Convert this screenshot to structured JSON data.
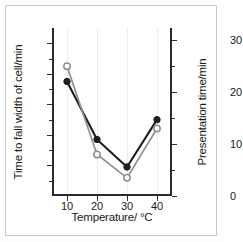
{
  "chart_data": {
    "type": "line",
    "title": "",
    "xlabel": "Temperature/ °C",
    "ylabel": "Time to fall width of cell/min",
    "y2label": "Presentation time/min",
    "x": [
      10,
      20,
      30,
      40
    ],
    "xlim": [
      5,
      45
    ],
    "ylim": [
      0,
      110
    ],
    "y2lim": [
      0,
      32.35
    ],
    "xticks": [
      "10",
      "20",
      "30",
      "40"
    ],
    "yticks": [
      "20",
      "40",
      "60",
      "80",
      "100"
    ],
    "y2ticks": [
      "0",
      "10",
      "20",
      "30"
    ],
    "grid": "vertical",
    "legend": "none",
    "series": [
      {
        "name": "Time to fall width of cell",
        "marker": "filled-circle",
        "axis": "left",
        "unit": "min",
        "color": "#1f1f1f",
        "values": [
          75,
          37,
          19,
          50
        ]
      },
      {
        "name": "Presentation time",
        "marker": "open-circle",
        "axis": "right",
        "unit": "min",
        "color": "#8f8f8f",
        "values": [
          25,
          8,
          3.5,
          13
        ]
      }
    ]
  },
  "axes": {
    "left": {
      "label": "Time to fall width of cell/min",
      "ticks": [
        {
          "text": "100",
          "value": 100
        },
        {
          "text": "80",
          "value": 80
        },
        {
          "text": "60",
          "value": 60
        },
        {
          "text": "40",
          "value": 40
        },
        {
          "text": "20",
          "value": 20
        }
      ]
    },
    "right": {
      "label": "Presentation time/min",
      "ticks": [
        {
          "text": "30",
          "value": 30
        },
        {
          "text": "20",
          "value": 20
        },
        {
          "text": "10",
          "value": 10
        },
        {
          "text": "0",
          "value": 0
        }
      ]
    },
    "bottom": {
      "label": "Temperature/ °C",
      "ticks": [
        {
          "text": "10",
          "value": 10
        },
        {
          "text": "20",
          "value": 20
        },
        {
          "text": "30",
          "value": 30
        },
        {
          "text": "40",
          "value": 40
        }
      ]
    }
  },
  "colors": {
    "series_filled": "#1f1f1f",
    "series_open_line": "#8f8f8f",
    "axis": "#2b2b2b",
    "gridline": "#ededed",
    "border": "#c9c9c9",
    "background": "#ffffff"
  }
}
